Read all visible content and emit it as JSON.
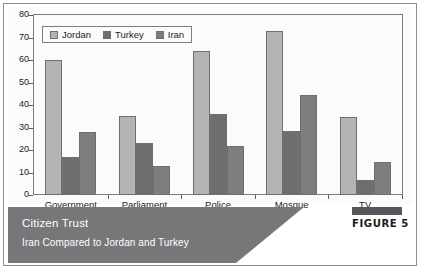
{
  "chart_data": {
    "type": "bar",
    "title": "Citizen Trust",
    "subtitle": "Iran Compared to Jordan and Turkey",
    "xlabel": "",
    "ylabel": "",
    "ylim": [
      0,
      80
    ],
    "yticks": [
      0,
      10,
      20,
      30,
      40,
      50,
      60,
      70,
      80
    ],
    "grid": false,
    "legend_position": "top-left",
    "categories": [
      "Government",
      "Parliament",
      "Police",
      "Mosque",
      "TV"
    ],
    "series": [
      {
        "name": "Jordan",
        "color": "#b4b4b4",
        "values": [
          60,
          35,
          64,
          73,
          34.5
        ]
      },
      {
        "name": "Turkey",
        "color": "#6e6e6e",
        "values": [
          17,
          23,
          36,
          28.5,
          6.5
        ]
      },
      {
        "name": "Iran",
        "color": "#7e7e7e",
        "values": [
          28,
          13,
          22,
          44.5,
          14.5
        ]
      }
    ]
  },
  "caption": {
    "title": "Citizen Trust",
    "subtitle": "Iran Compared to Jordan and Turkey",
    "band_color": "#77777a"
  },
  "badge": {
    "label": "FIGURE 5",
    "bar_color": "#58585a"
  }
}
